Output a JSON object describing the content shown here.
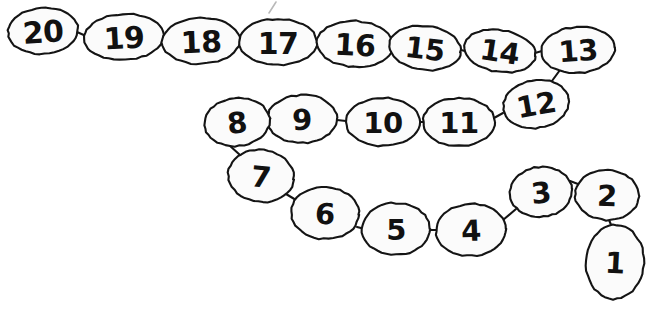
{
  "page": {
    "background_color": "#ffffff",
    "ink_color": "#141414",
    "bubble_fill": "#fbfbfb",
    "stray_mark_color": "#b9b9b9"
  },
  "chain": {
    "description": "Handwritten numbered chain of 20 ovals counting down from 20 to 1 in a snaking path",
    "count": 20,
    "order": "descending",
    "bubbles": [
      {
        "label": "20",
        "cx": 43,
        "cy": 31,
        "rx": 35,
        "ry": 23,
        "rot": -4,
        "font_size": 30
      },
      {
        "label": "19",
        "cx": 124,
        "cy": 37,
        "rx": 40,
        "ry": 23,
        "rot": -3,
        "font_size": 30
      },
      {
        "label": "18",
        "cx": 201,
        "cy": 41,
        "rx": 39,
        "ry": 23,
        "rot": -2,
        "font_size": 30
      },
      {
        "label": "17",
        "cx": 278,
        "cy": 42,
        "rx": 39,
        "ry": 23,
        "rot": 0,
        "font_size": 30
      },
      {
        "label": "16",
        "cx": 355,
        "cy": 44,
        "rx": 38,
        "ry": 23,
        "rot": 3,
        "font_size": 30
      },
      {
        "label": "15",
        "cx": 425,
        "cy": 48,
        "rx": 36,
        "ry": 22,
        "rot": 7,
        "font_size": 29
      },
      {
        "label": "14",
        "cx": 500,
        "cy": 51,
        "rx": 36,
        "ry": 21,
        "rot": 9,
        "font_size": 29
      },
      {
        "label": "13",
        "cx": 578,
        "cy": 50,
        "rx": 37,
        "ry": 23,
        "rot": -4,
        "font_size": 29
      },
      {
        "label": "12",
        "cx": 536,
        "cy": 104,
        "rx": 33,
        "ry": 24,
        "rot": -10,
        "font_size": 29
      },
      {
        "label": "11",
        "cx": 459,
        "cy": 122,
        "rx": 36,
        "ry": 24,
        "rot": 0,
        "font_size": 29
      },
      {
        "label": "10",
        "cx": 383,
        "cy": 122,
        "rx": 37,
        "ry": 24,
        "rot": 0,
        "font_size": 29
      },
      {
        "label": "9",
        "cx": 302,
        "cy": 119,
        "rx": 35,
        "ry": 24,
        "rot": -2,
        "font_size": 29
      },
      {
        "label": "8",
        "cx": 237,
        "cy": 122,
        "rx": 33,
        "ry": 24,
        "rot": -6,
        "font_size": 29
      },
      {
        "label": "7",
        "cx": 261,
        "cy": 176,
        "rx": 33,
        "ry": 26,
        "rot": 6,
        "font_size": 29
      },
      {
        "label": "6",
        "cx": 325,
        "cy": 213,
        "rx": 34,
        "ry": 26,
        "rot": 3,
        "font_size": 29
      },
      {
        "label": "5",
        "cx": 396,
        "cy": 229,
        "rx": 34,
        "ry": 26,
        "rot": 0,
        "font_size": 29
      },
      {
        "label": "4",
        "cx": 471,
        "cy": 230,
        "rx": 35,
        "ry": 26,
        "rot": -2,
        "font_size": 29
      },
      {
        "label": "3",
        "cx": 541,
        "cy": 192,
        "rx": 31,
        "ry": 25,
        "rot": -6,
        "font_size": 29
      },
      {
        "label": "2",
        "cx": 607,
        "cy": 195,
        "rx": 32,
        "ry": 25,
        "rot": 2,
        "font_size": 29
      },
      {
        "label": "1",
        "cx": 615,
        "cy": 262,
        "rx": 29,
        "ry": 37,
        "rot": 3,
        "font_size": 29
      }
    ],
    "links": [
      {
        "from": "20",
        "to": "19",
        "path": "M 77 32 L 86 36"
      },
      {
        "from": "19",
        "to": "18",
        "path": "M 163 39 L 163 39 M 162 39 L 163 41"
      },
      {
        "from": "18",
        "to": "17",
        "path": "M 240 42 L 240 42"
      },
      {
        "from": "17",
        "to": "16",
        "path": "M 317 43 L 318 44"
      },
      {
        "from": "16",
        "to": "15",
        "path": "M 392 46 L 390 47"
      },
      {
        "from": "15",
        "to": "14",
        "path": "M 461 50 L 465 51"
      },
      {
        "from": "14",
        "to": "13",
        "path": "M 535 53 L 542 51"
      },
      {
        "from": "13",
        "to": "12",
        "path": "M 560 70 L 549 85"
      },
      {
        "from": "12",
        "to": "11",
        "path": "M 503 113 L 494 118"
      },
      {
        "from": "11",
        "to": "10",
        "path": "M 423 122 L 420 122"
      },
      {
        "from": "10",
        "to": "9",
        "path": "M 346 121 L 337 120"
      },
      {
        "from": "9",
        "to": "8",
        "path": "M 268 120 L 270 120"
      },
      {
        "from": "8",
        "to": "7",
        "path": "M 229 145 L 240 155"
      },
      {
        "from": "7",
        "to": "6",
        "path": "M 286 194 L 296 200"
      },
      {
        "from": "6",
        "to": "5",
        "path": "M 357 227 L 365 229"
      },
      {
        "from": "5",
        "to": "4",
        "path": "M 430 230 L 437 230"
      },
      {
        "from": "4",
        "to": "3",
        "path": "M 503 220 L 516 209"
      },
      {
        "from": "3",
        "to": "2",
        "path": "M 570 181 L 578 184"
      },
      {
        "from": "2",
        "to": "1",
        "path": "M 609 220 L 612 227"
      }
    ],
    "stray_marks": [
      {
        "name": "pencil-tick-above-17",
        "path": "M 276 2 L 269 13"
      }
    ]
  }
}
